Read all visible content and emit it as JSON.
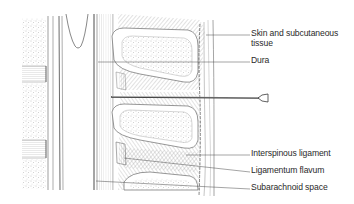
{
  "figure": {
    "labels": [
      {
        "id": "skin",
        "line1": "Skin and subcutaneous",
        "line2": "tissue"
      },
      {
        "id": "dura",
        "line1": "Dura"
      },
      {
        "id": "interspinous",
        "line1": "Interspinous ligament"
      },
      {
        "id": "flavum",
        "line1": "Ligamentum flavum"
      },
      {
        "id": "subarachnoid",
        "line1": "Subarachnoid space"
      }
    ]
  },
  "colors": {
    "ink": "#3a3a3a",
    "light_ink": "#8a8a8a",
    "bone_fill": "#ffffff",
    "background": "#ffffff"
  }
}
